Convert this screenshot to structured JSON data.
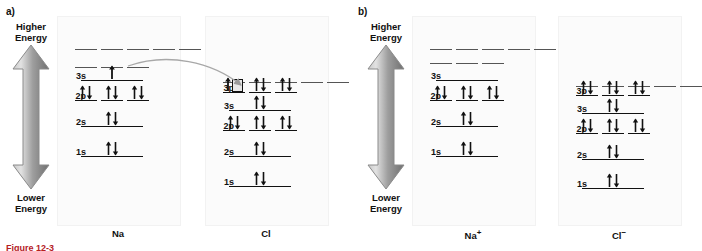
{
  "figure": {
    "sections": [
      {
        "id": "a",
        "label": "a)"
      },
      {
        "id": "b",
        "label": "b)"
      }
    ],
    "caption_partial": "Figure 12-3"
  },
  "energy_axes": [
    {
      "id": "axis-a",
      "top_label_line1": "Higher",
      "top_label_line2": "Energy",
      "bottom_label_line1": "Lower",
      "bottom_label_line2": "Energy"
    },
    {
      "id": "axis-b",
      "top_label_line1": "Higher",
      "top_label_line2": "Energy",
      "bottom_label_line1": "Lower",
      "bottom_label_line2": "Energy"
    }
  ],
  "orbital_labels": {
    "s1": "1s",
    "s2": "2s",
    "p2": "2p",
    "s3": "3s",
    "p3": "3p"
  },
  "panels": [
    {
      "id": "na",
      "species": "Na",
      "charge": "",
      "config": "1s2 2s2 2p6 3s1",
      "levels": [
        {
          "name": "top",
          "style": "dash",
          "boxes": 5,
          "electrons": [
            0,
            0,
            0,
            0,
            0
          ],
          "label": ""
        },
        {
          "name": "3p",
          "style": "dash",
          "boxes": 3,
          "electrons": [
            0,
            0,
            0
          ],
          "label": ""
        },
        {
          "name": "3s",
          "style": "solid",
          "boxes": 1,
          "electrons": [
            1
          ],
          "label": "3s"
        },
        {
          "name": "2p",
          "style": "solid",
          "boxes": 3,
          "electrons": [
            2,
            2,
            2
          ],
          "label": "2p"
        },
        {
          "name": "2s",
          "style": "solid",
          "boxes": 1,
          "electrons": [
            2
          ],
          "label": "2s"
        },
        {
          "name": "1s",
          "style": "solid",
          "boxes": 1,
          "electrons": [
            2
          ],
          "label": "1s"
        }
      ]
    },
    {
      "id": "cl",
      "species": "Cl",
      "charge": "",
      "config": "1s2 2s2 2p6 3s2 3p5",
      "levels": [
        {
          "name": "top",
          "style": "dash",
          "boxes": 5,
          "electrons": [
            0,
            0,
            0,
            0,
            0
          ],
          "label": ""
        },
        {
          "name": "3p",
          "style": "solid",
          "boxes": 3,
          "electrons": [
            1,
            2,
            2
          ],
          "label": "3p",
          "highlight_box": 0
        },
        {
          "name": "3s",
          "style": "solid",
          "boxes": 1,
          "electrons": [
            2
          ],
          "label": "3s"
        },
        {
          "name": "2p",
          "style": "solid",
          "boxes": 3,
          "electrons": [
            2,
            2,
            2
          ],
          "label": "2p"
        },
        {
          "name": "2s",
          "style": "solid",
          "boxes": 1,
          "electrons": [
            2
          ],
          "label": "2s"
        },
        {
          "name": "1s",
          "style": "solid",
          "boxes": 1,
          "electrons": [
            2
          ],
          "label": "1s"
        }
      ]
    },
    {
      "id": "na-plus",
      "species": "Na",
      "charge": "+",
      "config": "1s2 2s2 2p6",
      "levels": [
        {
          "name": "top",
          "style": "dash",
          "boxes": 5,
          "electrons": [
            0,
            0,
            0,
            0,
            0
          ],
          "label": ""
        },
        {
          "name": "3p",
          "style": "dash",
          "boxes": 3,
          "electrons": [
            0,
            0,
            0
          ],
          "label": ""
        },
        {
          "name": "3s",
          "style": "solid",
          "boxes": 1,
          "electrons": [
            0
          ],
          "label": "3s"
        },
        {
          "name": "2p",
          "style": "solid",
          "boxes": 3,
          "electrons": [
            2,
            2,
            2
          ],
          "label": "2p"
        },
        {
          "name": "2s",
          "style": "solid",
          "boxes": 1,
          "electrons": [
            2
          ],
          "label": "2s"
        },
        {
          "name": "1s",
          "style": "solid",
          "boxes": 1,
          "electrons": [
            2
          ],
          "label": "1s"
        }
      ]
    },
    {
      "id": "cl-minus",
      "species": "Cl",
      "charge": "−",
      "config": "1s2 2s2 2p6 3s2 3p6",
      "levels": [
        {
          "name": "top",
          "style": "dash",
          "boxes": 5,
          "electrons": [
            0,
            0,
            0,
            0,
            0
          ],
          "label": ""
        },
        {
          "name": "3p",
          "style": "solid",
          "boxes": 3,
          "electrons": [
            2,
            2,
            2
          ],
          "label": "3p"
        },
        {
          "name": "3s",
          "style": "solid",
          "boxes": 1,
          "electrons": [
            2
          ],
          "label": "3s"
        },
        {
          "name": "2p",
          "style": "solid",
          "boxes": 3,
          "electrons": [
            2,
            2,
            2
          ],
          "label": "2p"
        },
        {
          "name": "2s",
          "style": "solid",
          "boxes": 1,
          "electrons": [
            2
          ],
          "label": "2s"
        },
        {
          "name": "1s",
          "style": "solid",
          "boxes": 1,
          "electrons": [
            2
          ],
          "label": "1s"
        }
      ]
    }
  ],
  "transfer_arrow": {
    "from_panel": "na",
    "from_level": "3s",
    "to_panel": "cl",
    "to_level": "3p",
    "description": "electron transfer from Na 3s to Cl 3p"
  },
  "colors": {
    "line": "#111111",
    "dash_line": "#555555",
    "arrow_gray_light": "#d4d4d4",
    "arrow_gray_dark": "#7d7d7d",
    "panel_bg": "#fbfbfb",
    "caption_red": "#b5201f",
    "highlight_fill": "#e8e8e8"
  }
}
